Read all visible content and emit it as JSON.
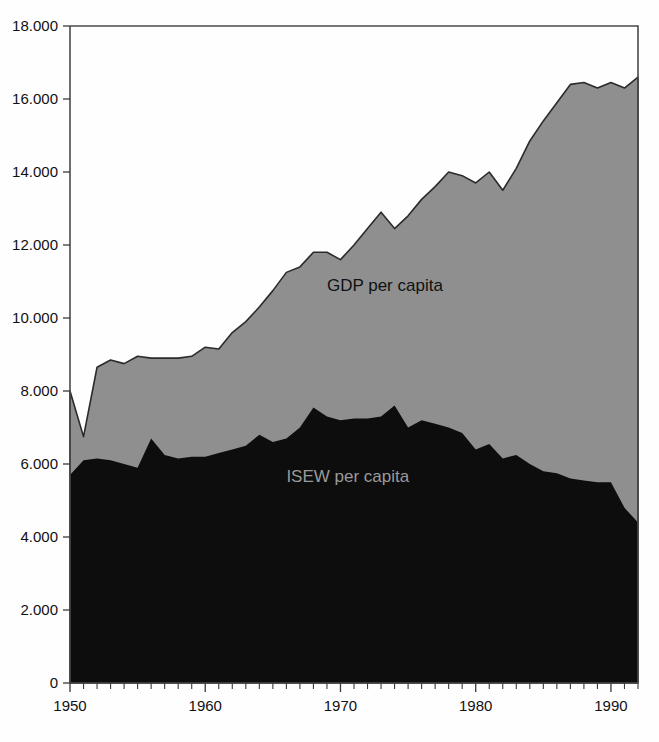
{
  "chart_data": {
    "type": "area",
    "title": "",
    "subtitle": "",
    "xlabel": "",
    "ylabel": "",
    "xlim": [
      1950,
      1992
    ],
    "ylim": [
      0,
      18000
    ],
    "grid": false,
    "legend_position": "inline-annotations",
    "x_tick_labels": [
      "1950",
      "1960",
      "1970",
      "1980",
      "1990"
    ],
    "x_tick_values": [
      1950,
      1960,
      1970,
      1980,
      1990
    ],
    "x_minor_tick_interval": 1,
    "y_tick_labels": [
      "0",
      "2.000",
      "4.000",
      "6.000",
      "8.000",
      "10.000",
      "12.000",
      "14.000",
      "16.000",
      "18.000"
    ],
    "y_tick_values": [
      0,
      2000,
      4000,
      6000,
      8000,
      10000,
      12000,
      14000,
      16000,
      18000
    ],
    "x": [
      1950,
      1951,
      1952,
      1953,
      1954,
      1955,
      1956,
      1957,
      1958,
      1959,
      1960,
      1961,
      1962,
      1963,
      1964,
      1965,
      1966,
      1967,
      1968,
      1969,
      1970,
      1971,
      1972,
      1973,
      1974,
      1975,
      1976,
      1977,
      1978,
      1979,
      1980,
      1981,
      1982,
      1983,
      1984,
      1985,
      1986,
      1987,
      1988,
      1989,
      1990,
      1991,
      1992
    ],
    "series": [
      {
        "name": "GDP per capita",
        "color": "#8f8f8f",
        "label_color": "#111111",
        "label_x": 1969,
        "label_y": 10750,
        "values": [
          8000,
          6750,
          8650,
          8850,
          8750,
          8950,
          8900,
          8900,
          8900,
          8950,
          9200,
          9150,
          9600,
          9900,
          10300,
          10750,
          11250,
          11400,
          11800,
          11800,
          11600,
          12000,
          12450,
          12900,
          12450,
          12800,
          13250,
          13600,
          14000,
          13900,
          13700,
          14000,
          13500,
          14100,
          14850,
          15400,
          15900,
          16400,
          16450,
          16300,
          16450,
          16300,
          16600
        ]
      },
      {
        "name": "ISEW per capita",
        "color": "#0d0d0d",
        "label_color": "#9a9a9a",
        "label_x": 1966,
        "label_y": 5500,
        "values": [
          5700,
          6100,
          6150,
          6100,
          6000,
          5900,
          6700,
          6250,
          6150,
          6200,
          6200,
          6300,
          6400,
          6500,
          6800,
          6600,
          6700,
          7000,
          7550,
          7300,
          7200,
          7250,
          7250,
          7300,
          7600,
          7000,
          7200,
          7100,
          7000,
          6850,
          6400,
          6550,
          6150,
          6250,
          6000,
          5800,
          5750,
          5600,
          5550,
          5500,
          5500,
          4800,
          4400
        ]
      }
    ]
  },
  "annotations": {
    "gdp_label": "GDP per capita",
    "isew_label": "ISEW per capita"
  }
}
